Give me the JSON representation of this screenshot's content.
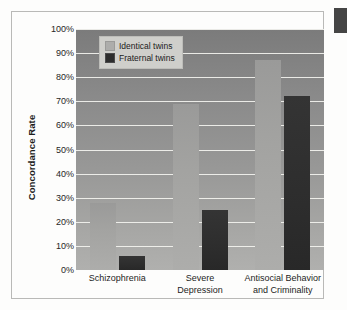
{
  "chart_data": {
    "type": "bar",
    "title": "",
    "xlabel": "",
    "ylabel": "Concordance Rate",
    "ylim": [
      0,
      100
    ],
    "grid": true,
    "legend_position": "top-left inside plot",
    "y_ticks": [
      "0%",
      "10%",
      "20%",
      "30%",
      "40%",
      "50%",
      "60%",
      "70%",
      "80%",
      "90%",
      "100%"
    ],
    "y_tick_values": [
      0,
      10,
      20,
      30,
      40,
      50,
      60,
      70,
      80,
      90,
      100
    ],
    "categories": [
      "Schizophrenia",
      "Severe Depression",
      "Antisocial Behavior and Criminality"
    ],
    "category_lines": [
      [
        "Schizophrenia"
      ],
      [
        "Severe",
        "Depression"
      ],
      [
        "Antisocial Behavior",
        "and Criminality"
      ]
    ],
    "series": [
      {
        "name": "Identical twins",
        "color": "#adadab",
        "values": [
          28,
          69,
          87
        ]
      },
      {
        "name": "Fraternal twins",
        "color": "#2d2d2d",
        "values": [
          6,
          25,
          72
        ]
      }
    ],
    "value_unit": "%"
  },
  "legend": {
    "items": [
      {
        "label": "Identical twins",
        "swatch": "light"
      },
      {
        "label": "Fraternal twins",
        "swatch": "dark"
      }
    ]
  },
  "colors": {
    "plot_background_top": "#7b7b7b",
    "plot_background_bottom": "#b0b0ae",
    "gridline": "#f3f3ef",
    "frame_border": "#b9b9b7",
    "page_background": "#fdfdfc",
    "identical_twins": "#adadab",
    "fraternal_twins": "#2d2d2d",
    "edge_notch": "#454545"
  }
}
